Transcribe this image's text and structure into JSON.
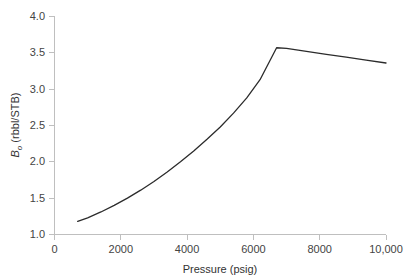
{
  "chart_data": {
    "type": "line",
    "title": "",
    "subtitle": "",
    "xlabel": "Pressure (psig)",
    "ylabel": "B_o (rbbl/STB)",
    "ylabel_main": "B",
    "ylabel_sub": "o",
    "ylabel_rest": " (rbbl/STB)",
    "xlim": [
      0,
      10000
    ],
    "ylim": [
      1.0,
      4.0
    ],
    "xticks": [
      0,
      2000,
      4000,
      6000,
      8000,
      10000
    ],
    "xtick_labels": [
      "0",
      "2000",
      "4000",
      "6000",
      "8000",
      "10,000"
    ],
    "yticks": [
      1.0,
      1.5,
      2.0,
      2.5,
      3.0,
      3.5,
      4.0
    ],
    "ytick_labels": [
      "1.0",
      "1.5",
      "2.0",
      "2.5",
      "3.0",
      "3.5",
      "4.0"
    ],
    "grid": false,
    "legend": false,
    "legend_position": "none",
    "line_color": "#2b2b2b",
    "axis_color": "#bfbfbf",
    "background_color": "#ffffff",
    "bubble_point": {
      "x": 6700,
      "y": 3.57
    },
    "series": [
      {
        "name": "Oil formation volume factor",
        "x": [
          700,
          1000,
          1400,
          1800,
          2200,
          2600,
          3000,
          3400,
          3800,
          4200,
          4600,
          5000,
          5400,
          5800,
          6200,
          6700,
          7000,
          7600,
          8200,
          8800,
          9400,
          10000
        ],
        "values": [
          1.18,
          1.23,
          1.31,
          1.4,
          1.5,
          1.61,
          1.73,
          1.86,
          2.0,
          2.15,
          2.31,
          2.48,
          2.67,
          2.88,
          3.13,
          3.57,
          3.56,
          3.52,
          3.48,
          3.44,
          3.4,
          3.36
        ]
      }
    ],
    "annotations": []
  }
}
